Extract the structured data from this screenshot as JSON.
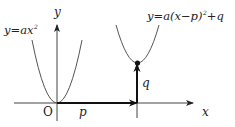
{
  "diagram": {
    "labels": {
      "y_axis": "y",
      "x_axis": "x",
      "origin": "O",
      "p": "p",
      "q": "q",
      "base_curve_lhs": "y=ax",
      "base_curve_exp": "2",
      "shifted_curve_lhs": "y=a(x−p)",
      "shifted_curve_exp": "2",
      "shifted_curve_rhs": "+q"
    },
    "curves": [
      {
        "name": "y=ax²",
        "vertex": [
          0,
          0
        ]
      },
      {
        "name": "y=a(x−p)²+q",
        "vertex": [
          "p",
          "q"
        ]
      }
    ],
    "arrows": [
      {
        "name": "horizontal shift",
        "label": "p",
        "from": [
          0,
          0
        ],
        "to": [
          "p",
          0
        ]
      },
      {
        "name": "vertical shift",
        "label": "q",
        "from": [
          "p",
          0
        ],
        "to": [
          "p",
          "q"
        ]
      }
    ],
    "colors": {
      "line": "#333333",
      "curve": "#555555",
      "text": "#222222",
      "background": "#ffffff"
    }
  }
}
